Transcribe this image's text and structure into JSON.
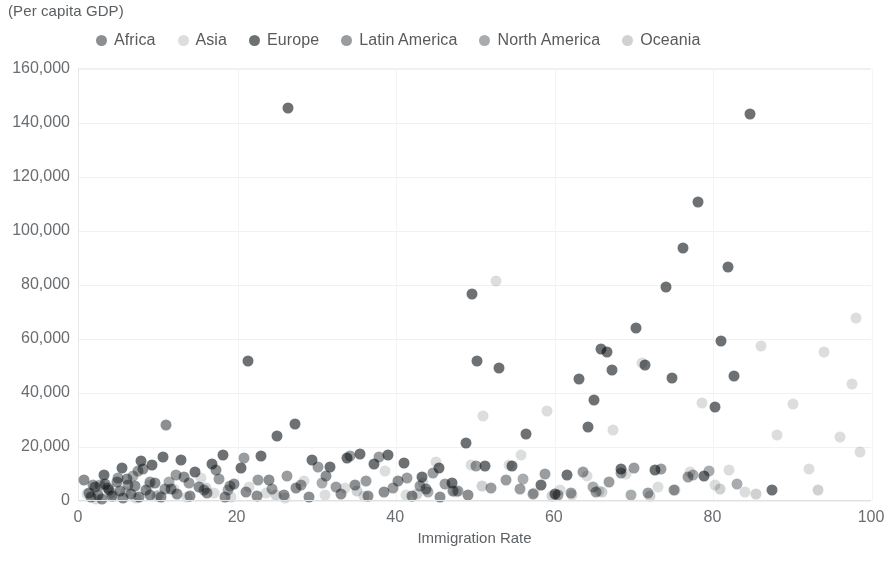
{
  "subtitle": "(Per capita GDP)",
  "legend": {
    "position": "top",
    "items": [
      {
        "label": "Africa",
        "color": "#8c8f91"
      },
      {
        "label": "Asia",
        "color": "#dcdddd"
      },
      {
        "label": "Europe",
        "color": "#6e7173"
      },
      {
        "label": "Latin America",
        "color": "#9a9d9f"
      },
      {
        "label": "North America",
        "color": "#a9acae"
      },
      {
        "label": "Oceania",
        "color": "#cfd1d2"
      }
    ]
  },
  "axes": {
    "x": {
      "label": "Immigration Rate",
      "min": 0,
      "max": 100,
      "ticks": [
        "0",
        "20",
        "40",
        "60",
        "80",
        "100"
      ],
      "tick_values": [
        0,
        20,
        40,
        60,
        80,
        100
      ]
    },
    "y": {
      "label": "",
      "min": 0,
      "max": 160000,
      "ticks": [
        "0",
        "20,000",
        "40,000",
        "60,000",
        "80,000",
        "100,000",
        "120,000",
        "140,000",
        "160,000"
      ],
      "tick_values": [
        0,
        20000,
        40000,
        60000,
        80000,
        100000,
        120000,
        140000,
        160000
      ]
    }
  },
  "chart_data": {
    "type": "scatter",
    "title": "",
    "subtitle": "(Per capita GDP)",
    "xlabel": "Immigration Rate",
    "ylabel": "(Per capita GDP)",
    "xlim": [
      0,
      100
    ],
    "ylim": [
      0,
      160000
    ],
    "grid": true,
    "legend_position": "top",
    "marker_size": 11,
    "series": [
      {
        "name": "Africa",
        "color": "#8c8f91",
        "points": [
          [
            0.6,
            7800
          ],
          [
            1.2,
            3100
          ],
          [
            1.5,
            1500
          ],
          [
            2.0,
            5200
          ],
          [
            2.4,
            2300
          ],
          [
            2.9,
            900
          ],
          [
            3.3,
            6400
          ],
          [
            3.8,
            4100
          ],
          [
            4.2,
            1800
          ],
          [
            4.8,
            7000
          ],
          [
            5.2,
            3600
          ],
          [
            5.6,
            1200
          ],
          [
            6.1,
            8200
          ],
          [
            6.6,
            2700
          ],
          [
            7.0,
            5500
          ],
          [
            7.6,
            1600
          ],
          [
            8.1,
            11800
          ],
          [
            8.5,
            3900
          ],
          [
            9.0,
            2100
          ],
          [
            9.6,
            6700
          ],
          [
            10.3,
            1400
          ],
          [
            11.0,
            28300
          ],
          [
            11.6,
            4300
          ],
          [
            12.4,
            2500
          ],
          [
            13.2,
            8900
          ],
          [
            14.0,
            1700
          ],
          [
            15.1,
            5100
          ],
          [
            16.2,
            2900
          ],
          [
            17.3,
            11500
          ],
          [
            18.4,
            1300
          ],
          [
            19.6,
            6200
          ],
          [
            21.0,
            3400
          ],
          [
            22.5,
            1900
          ],
          [
            24.0,
            7600
          ],
          [
            25.8,
            2200
          ],
          [
            27.4,
            4800
          ],
          [
            29.0,
            1500
          ],
          [
            31.2,
            9100
          ],
          [
            33.0,
            2600
          ],
          [
            34.8,
            5900
          ],
          [
            36.5,
            1800
          ],
          [
            38.4,
            3200
          ],
          [
            40.2,
            7400
          ],
          [
            42.0,
            2000
          ],
          [
            43.8,
            4500
          ],
          [
            45.5,
            1600
          ],
          [
            47.2,
            3800
          ],
          [
            49.0,
            2400
          ]
        ]
      },
      {
        "name": "Asia",
        "color": "#dcdddd",
        "points": [
          [
            1.0,
            2600
          ],
          [
            2.2,
            900
          ],
          [
            3.1,
            5400
          ],
          [
            4.4,
            1700
          ],
          [
            5.9,
            3300
          ],
          [
            7.2,
            1100
          ],
          [
            8.8,
            6100
          ],
          [
            10.1,
            2200
          ],
          [
            12.0,
            4400
          ],
          [
            13.6,
            1400
          ],
          [
            15.4,
            8600
          ],
          [
            17.0,
            2800
          ],
          [
            19.2,
            1600
          ],
          [
            21.4,
            5200
          ],
          [
            23.6,
            3000
          ],
          [
            26.0,
            1200
          ],
          [
            28.4,
            7300
          ],
          [
            31.0,
            2400
          ],
          [
            33.5,
            4900
          ],
          [
            36.0,
            1800
          ],
          [
            38.6,
            11200
          ],
          [
            41.2,
            2100
          ],
          [
            43.4,
            6800
          ],
          [
            45.0,
            14600
          ],
          [
            47.6,
            3500
          ],
          [
            49.4,
            13400
          ],
          [
            51.0,
            31300
          ],
          [
            52.6,
            81600
          ],
          [
            54.2,
            13200
          ],
          [
            55.8,
            17200
          ],
          [
            57.4,
            2900
          ],
          [
            59.0,
            33400
          ],
          [
            60.6,
            4200
          ],
          [
            62.2,
            2300
          ],
          [
            64.0,
            9400
          ],
          [
            65.6,
            3700
          ],
          [
            67.4,
            26200
          ],
          [
            69.0,
            10100
          ],
          [
            71.0,
            51200
          ],
          [
            73.0,
            5300
          ],
          [
            75.2,
            4100
          ],
          [
            77.0,
            10800
          ],
          [
            78.6,
            36200
          ],
          [
            80.2,
            5900
          ],
          [
            82.0,
            11600
          ],
          [
            84.0,
            3300
          ],
          [
            86.0,
            57300
          ],
          [
            88.0,
            24400
          ],
          [
            90.0,
            35800
          ],
          [
            92.0,
            11900
          ],
          [
            94.0,
            55200
          ],
          [
            96.0,
            23600
          ],
          [
            97.5,
            43500
          ],
          [
            98.5,
            18200
          ],
          [
            98.0,
            67900
          ]
        ]
      },
      {
        "name": "Europe",
        "color": "#6e7173",
        "points": [
          [
            3.2,
            9600
          ],
          [
            5.4,
            12400
          ],
          [
            7.8,
            14900
          ],
          [
            9.2,
            13200
          ],
          [
            10.6,
            16400
          ],
          [
            12.8,
            15100
          ],
          [
            14.6,
            10900
          ],
          [
            16.8,
            13800
          ],
          [
            18.2,
            17100
          ],
          [
            20.4,
            12200
          ],
          [
            21.3,
            51700
          ],
          [
            23.0,
            16800
          ],
          [
            25.0,
            23900
          ],
          [
            26.4,
            145700
          ],
          [
            27.2,
            28600
          ],
          [
            29.4,
            15300
          ],
          [
            31.6,
            12700
          ],
          [
            33.8,
            16100
          ],
          [
            35.4,
            17300
          ],
          [
            37.2,
            13600
          ],
          [
            39.0,
            16900
          ],
          [
            41.0,
            14200
          ],
          [
            43.2,
            8800
          ],
          [
            45.4,
            12100
          ],
          [
            47.0,
            6800
          ],
          [
            48.8,
            21400
          ],
          [
            49.5,
            76800
          ],
          [
            50.2,
            51900
          ],
          [
            51.2,
            12800
          ],
          [
            53.0,
            49200
          ],
          [
            54.6,
            13100
          ],
          [
            56.4,
            24800
          ],
          [
            58.2,
            5900
          ],
          [
            60.0,
            2700
          ],
          [
            61.6,
            9800
          ],
          [
            63.0,
            45200
          ],
          [
            64.2,
            27400
          ],
          [
            65.0,
            37400
          ],
          [
            65.8,
            56400
          ],
          [
            66.6,
            55200
          ],
          [
            67.2,
            48500
          ],
          [
            68.4,
            11900
          ],
          [
            70.2,
            63900
          ],
          [
            71.4,
            50500
          ],
          [
            72.6,
            11400
          ],
          [
            74.0,
            79300
          ],
          [
            74.8,
            45400
          ],
          [
            76.2,
            93600
          ],
          [
            78.0,
            110700
          ],
          [
            78.8,
            9200
          ],
          [
            80.2,
            34900
          ],
          [
            81.0,
            59200
          ],
          [
            81.8,
            86800
          ],
          [
            82.6,
            46300
          ],
          [
            84.6,
            143300
          ],
          [
            87.4,
            4100
          ]
        ]
      },
      {
        "name": "Latin America",
        "color": "#9a9d9f",
        "points": [
          [
            1.8,
            6100
          ],
          [
            3.6,
            4700
          ],
          [
            4.9,
            8400
          ],
          [
            6.2,
            5900
          ],
          [
            7.4,
            11200
          ],
          [
            8.9,
            7200
          ],
          [
            10.8,
            4300
          ],
          [
            12.2,
            9700
          ],
          [
            13.9,
            6500
          ],
          [
            15.8,
            3900
          ],
          [
            17.6,
            8100
          ],
          [
            19.0,
            5400
          ],
          [
            20.8,
            15800
          ],
          [
            22.6,
            7800
          ],
          [
            24.4,
            4600
          ],
          [
            26.2,
            9200
          ],
          [
            28.0,
            6000
          ],
          [
            30.2,
            12700
          ],
          [
            32.4,
            5100
          ],
          [
            34.2,
            16700
          ],
          [
            36.2,
            7400
          ],
          [
            37.8,
            16300
          ],
          [
            39.6,
            4900
          ],
          [
            41.4,
            8700
          ],
          [
            43.0,
            5600
          ],
          [
            44.6,
            10300
          ],
          [
            46.2,
            6200
          ],
          [
            47.8,
            3800
          ],
          [
            50.0,
            13100
          ],
          [
            52.0,
            5000
          ],
          [
            53.8,
            7900
          ],
          [
            55.6,
            4400
          ],
          [
            57.2,
            2600
          ],
          [
            58.8,
            9900
          ],
          [
            60.4,
            2200
          ],
          [
            62.0,
            3100
          ],
          [
            63.6,
            10900
          ],
          [
            65.2,
            3500
          ],
          [
            66.8,
            6900
          ],
          [
            68.4,
            10200
          ],
          [
            70.0,
            12300
          ],
          [
            71.8,
            2800
          ],
          [
            73.4,
            11700
          ],
          [
            75.0,
            4000
          ],
          [
            76.8,
            8900
          ]
        ]
      },
      {
        "name": "North America",
        "color": "#a9acae",
        "points": [
          [
            2.6,
            5800
          ],
          [
            6.8,
            9300
          ],
          [
            11.4,
            7100
          ],
          [
            18.8,
            4200
          ],
          [
            30.6,
            6600
          ],
          [
            44.0,
            3400
          ],
          [
            56.0,
            8000
          ],
          [
            64.8,
            5200
          ],
          [
            69.6,
            2400
          ],
          [
            77.4,
            9600
          ],
          [
            79.4,
            11200
          ],
          [
            83.0,
            6300
          ]
        ]
      },
      {
        "name": "Oceania",
        "color": "#cfd1d2",
        "points": [
          [
            4.0,
            3000
          ],
          [
            9.8,
            1900
          ],
          [
            16.0,
            4800
          ],
          [
            24.8,
            2100
          ],
          [
            35.0,
            3600
          ],
          [
            42.6,
            2500
          ],
          [
            50.8,
            5700
          ],
          [
            59.6,
            1700
          ],
          [
            66.0,
            3200
          ],
          [
            72.0,
            2000
          ],
          [
            80.8,
            4400
          ],
          [
            85.4,
            2700
          ],
          [
            93.2,
            3900
          ]
        ]
      }
    ]
  }
}
